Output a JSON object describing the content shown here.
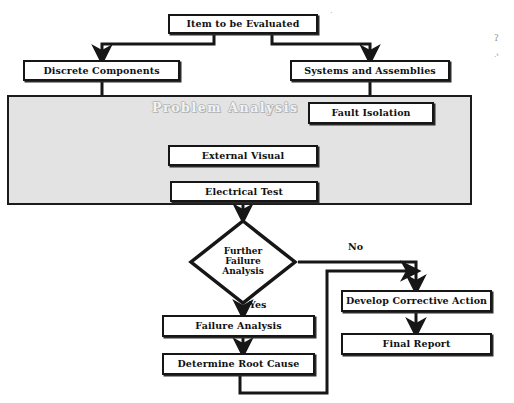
{
  "diagram": {
    "canvas": {
      "width": 514,
      "height": 403,
      "background": "#ffffff"
    },
    "colors": {
      "node_fill": "#ffffff",
      "node_border": "#161616",
      "band_fill": "#e3e3e3",
      "band_border": "#1b1b1b",
      "band_title_text": "#f2f2f2",
      "wire": "#161616",
      "text": "#111111"
    },
    "band": {
      "label": "Problem Analysis",
      "x": 7,
      "y": 95,
      "width": 465,
      "height": 110
    },
    "nodes": [
      {
        "id": "item",
        "label": "Item to be Evaluated",
        "x": 168,
        "y": 14,
        "width": 150,
        "height": 20,
        "font_size": 9.5,
        "shape": "rect"
      },
      {
        "id": "discrete",
        "label": "Discrete Components",
        "x": 23,
        "y": 60,
        "width": 157,
        "height": 21,
        "font_size": 9.5,
        "shape": "rect"
      },
      {
        "id": "systems",
        "label": "Systems and Assemblies",
        "x": 290,
        "y": 60,
        "width": 160,
        "height": 21,
        "font_size": 9.5,
        "shape": "rect"
      },
      {
        "id": "fault",
        "label": "Fault Isolation",
        "x": 308,
        "y": 102,
        "width": 126,
        "height": 22,
        "font_size": 9.5,
        "shape": "rect"
      },
      {
        "id": "external",
        "label": "External Visual",
        "x": 168,
        "y": 145,
        "width": 150,
        "height": 21,
        "font_size": 9.5,
        "shape": "rect"
      },
      {
        "id": "electrical",
        "label": "Electrical Test",
        "x": 170,
        "y": 181,
        "width": 148,
        "height": 21,
        "font_size": 9.5,
        "shape": "rect"
      },
      {
        "id": "failure",
        "label": "Failure Analysis",
        "x": 162,
        "y": 315,
        "width": 153,
        "height": 22,
        "font_size": 9.5,
        "shape": "rect"
      },
      {
        "id": "rootcause",
        "label": "Determine Root Cause",
        "x": 162,
        "y": 353,
        "width": 153,
        "height": 22,
        "font_size": 9.5,
        "shape": "rect"
      },
      {
        "id": "corrective",
        "label": "Develop Corrective Action",
        "x": 341,
        "y": 290,
        "width": 151,
        "height": 22,
        "font_size": 9.5,
        "shape": "rect"
      },
      {
        "id": "report",
        "label": "Final Report",
        "x": 341,
        "y": 333,
        "width": 151,
        "height": 22,
        "font_size": 9.5,
        "shape": "rect"
      }
    ],
    "decision": {
      "id": "further",
      "lines": [
        "Further",
        "Failure",
        "Analysis"
      ],
      "x": 188,
      "y": 218,
      "width": 110,
      "height": 88,
      "font_size": 9
    },
    "edge_labels": [
      {
        "id": "no",
        "text": "No",
        "x": 348,
        "y": 241,
        "font_size": 9.5
      },
      {
        "id": "yes",
        "text": "Yes",
        "x": 249,
        "y": 299,
        "font_size": 9.5
      }
    ],
    "edges": [
      {
        "from": "item",
        "to": "discrete",
        "kind": "elbow-down-left",
        "arrow": true
      },
      {
        "from": "item",
        "to": "systems",
        "kind": "elbow-down-right",
        "arrow": true
      },
      {
        "from": "discrete",
        "to": "external",
        "kind": "elbow-down-right",
        "arrow": true
      },
      {
        "from": "systems",
        "to": "fault",
        "kind": "straight-down",
        "arrow": false
      },
      {
        "from": "fault",
        "to": "external",
        "kind": "elbow-down-left",
        "arrow": true
      },
      {
        "from": "external",
        "to": "electrical",
        "kind": "straight-down",
        "arrow": true
      },
      {
        "from": "electrical",
        "to": "further",
        "kind": "straight-down",
        "arrow": true
      },
      {
        "from": "further",
        "to": "failure",
        "kind": "straight-down",
        "arrow": true,
        "label": "Yes"
      },
      {
        "from": "further",
        "to": "corrective",
        "kind": "elbow-right-down",
        "arrow": true,
        "label": "No"
      },
      {
        "from": "failure",
        "to": "rootcause",
        "kind": "straight-down",
        "arrow": true
      },
      {
        "from": "rootcause",
        "to": "corrective",
        "kind": "feedback-loop",
        "arrow": true
      },
      {
        "from": "corrective",
        "to": "report",
        "kind": "straight-down",
        "arrow": true
      }
    ],
    "artifacts": [
      {
        "id": "speck-right-upper",
        "text": "ʔ",
        "x": 494,
        "y": 33,
        "font_size": 9
      },
      {
        "id": "speck-right-lower",
        "text": "·ᵗ",
        "x": 494,
        "y": 52,
        "font_size": 8
      },
      {
        "id": "speck-mid-top",
        "text": "·",
        "x": 330,
        "y": 8,
        "font_size": 8
      }
    ]
  }
}
